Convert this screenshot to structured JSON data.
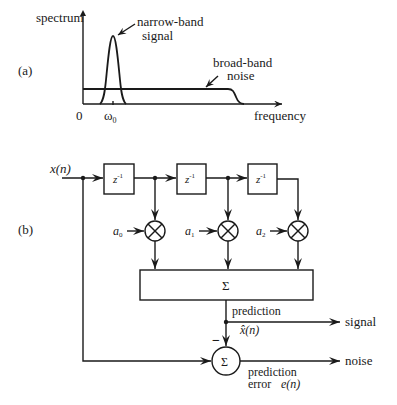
{
  "panel_a": {
    "label": "(a)",
    "y_axis_label": "spectrum",
    "x_axis_label": "frequency",
    "origin_label": "0",
    "omega_label": "ω",
    "omega_sub": "0",
    "signal_label_line1": "narrow-band",
    "signal_label_line2": "signal",
    "noise_label_line1": "broad-band",
    "noise_label_line2": "noise"
  },
  "panel_b": {
    "label": "(b)",
    "input_label": "x(n)",
    "delay_label": "z",
    "delay_exp": "-1",
    "coefficients": [
      {
        "name": "a",
        "sub": "0"
      },
      {
        "name": "a",
        "sub": "1"
      },
      {
        "name": "a",
        "sub": "2"
      }
    ],
    "sum_symbol": "Σ",
    "prediction_label": "prediction",
    "prediction_var": "x̂(n)",
    "signal_output": "signal",
    "minus_sign": "−",
    "error_label_line1": "prediction",
    "error_label_line2": "error",
    "error_var": "e(n)",
    "noise_output": "noise"
  }
}
